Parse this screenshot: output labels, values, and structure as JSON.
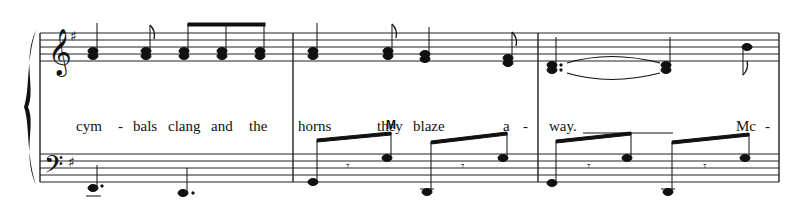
{
  "score": {
    "system": "grand-staff",
    "treble": {
      "clef": "treble",
      "key_signature": "G major (1 sharp)"
    },
    "bass": {
      "clef": "bass",
      "key_signature": "G major (1 sharp)"
    },
    "measure_count": 3
  },
  "lyrics": [
    {
      "text": "cym",
      "x": 76
    },
    {
      "text": "-",
      "x": 118
    },
    {
      "text": "bals",
      "x": 133
    },
    {
      "text": "clang",
      "x": 168
    },
    {
      "text": "and",
      "x": 211
    },
    {
      "text": "the",
      "x": 249
    },
    {
      "text": "horns",
      "x": 298
    },
    {
      "text": "they",
      "x": 377
    },
    {
      "text": "blaze",
      "x": 413
    },
    {
      "text": "a",
      "x": 503
    },
    {
      "text": "-",
      "x": 523
    },
    {
      "text": "way.",
      "x": 549
    },
    {
      "text": "Mc",
      "x": 736
    },
    {
      "text": "-",
      "x": 765
    }
  ],
  "markings": [
    {
      "text": "M",
      "x": 386,
      "y": 118
    }
  ],
  "colors": {
    "ink": "#111111",
    "paper": "#ffffff"
  }
}
